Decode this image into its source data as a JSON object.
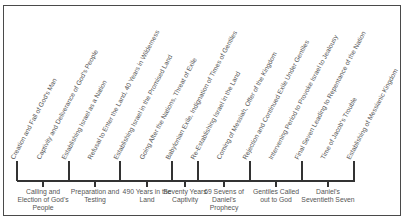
{
  "diagram": {
    "type": "timeline",
    "events": [
      {
        "label": "Creation and Fall of God's Man",
        "x": 16,
        "y": 153
      },
      {
        "label": "Captivity and Deliverance of God's People",
        "x": 42,
        "y": 153
      },
      {
        "label": "Establishing Israel as a Nation",
        "x": 67,
        "y": 153
      },
      {
        "label": "Refusal to Enter the Land, 40 Years in Wilderness",
        "x": 93,
        "y": 153
      },
      {
        "label": "Establishing Israel in the Promised Land",
        "x": 119,
        "y": 153
      },
      {
        "label": "Going After the Nations, Threat of Exile",
        "x": 145,
        "y": 153
      },
      {
        "label": "Babylonian Exile, Indignation of Times of Gentiles",
        "x": 171,
        "y": 153
      },
      {
        "label": "Re-Establishing Israel in the Land",
        "x": 196,
        "y": 153
      },
      {
        "label": "Coming of Messiah, Offer of the Kingdom",
        "x": 222,
        "y": 153
      },
      {
        "label": "Rejection and Continued Exile Under Gentiles",
        "x": 248,
        "y": 153
      },
      {
        "label": "Intervening Period to Provoke Israel to Jealousy",
        "x": 274,
        "y": 153
      },
      {
        "label": "Final Seven Leading to Repentance of the Nation",
        "x": 300,
        "y": 153
      },
      {
        "label": "Time of Jacob's Trouble",
        "x": 326,
        "y": 153
      },
      {
        "label": "Establishing of Messianic Kingdom",
        "x": 352,
        "y": 153
      }
    ],
    "major_ticks": [
      17,
      69,
      120,
      172,
      198,
      250,
      302,
      354
    ],
    "periods": [
      {
        "label": "Calling and Election of God's People",
        "x": 43
      },
      {
        "label": "Preparation and Testing",
        "x": 95
      },
      {
        "label": "490 Years in the Land",
        "x": 147
      },
      {
        "label": "Seventy Years Captivity",
        "x": 185
      },
      {
        "label": "69 Sevens of Daniel's Prophecy",
        "x": 224
      },
      {
        "label": "Gentiles Called out to God",
        "x": 276
      },
      {
        "label": "Daniel's Seventieth Seven",
        "x": 328
      }
    ],
    "colors": {
      "line": "#333333",
      "text": "#555555",
      "frame": "#4a4a4a"
    }
  }
}
